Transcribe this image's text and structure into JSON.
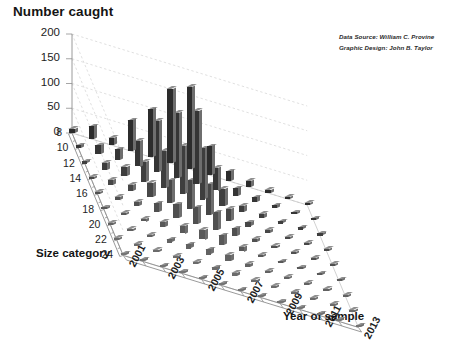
{
  "chart_data": {
    "type": "bar",
    "subtype": "3d-bar",
    "title": "Number caught",
    "xlabel": "Year of sample",
    "ylabel": "Number caught",
    "zlabel": "Size category",
    "ylim": [
      0,
      200
    ],
    "yticks": [
      0,
      50,
      100,
      150,
      200
    ],
    "grid": true,
    "legend": false,
    "x": [
      2001,
      2002,
      2003,
      2004,
      2005,
      2006,
      2007,
      2008,
      2009,
      2010,
      2011,
      2012,
      2013
    ],
    "xtick_labels": [
      "2001",
      "2003",
      "2005",
      "2007",
      "2009",
      "2011",
      "2013"
    ],
    "z_categories": [
      8,
      10,
      12,
      14,
      16,
      18,
      20,
      22,
      24
    ],
    "ztick_labels": [
      "8",
      "10",
      "12",
      "14",
      "16",
      "18",
      "20",
      "22",
      "24"
    ],
    "annotations": [
      "Data Source: William C. Provine",
      "Graphic Design: John B. Taylor"
    ],
    "series": [
      {
        "name": "8",
        "values": [
          8,
          26,
          14,
          62,
          96,
          150,
          166,
          58,
          20,
          12,
          7,
          5,
          3
        ]
      },
      {
        "name": "10",
        "values": [
          6,
          18,
          22,
          52,
          104,
          132,
          148,
          46,
          16,
          10,
          6,
          4,
          3
        ]
      },
      {
        "name": "12",
        "values": [
          5,
          14,
          18,
          40,
          74,
          96,
          104,
          34,
          12,
          8,
          5,
          3,
          2
        ]
      },
      {
        "name": "14",
        "values": [
          4,
          10,
          12,
          28,
          46,
          58,
          62,
          24,
          9,
          6,
          4,
          3,
          2
        ]
      },
      {
        "name": "16",
        "values": [
          3,
          7,
          9,
          18,
          28,
          34,
          36,
          16,
          7,
          5,
          3,
          2,
          2
        ]
      },
      {
        "name": "18",
        "values": [
          2,
          5,
          6,
          11,
          16,
          20,
          21,
          10,
          5,
          4,
          3,
          2,
          1
        ]
      },
      {
        "name": "20",
        "values": [
          2,
          3,
          4,
          7,
          9,
          11,
          12,
          6,
          4,
          3,
          2,
          2,
          1
        ]
      },
      {
        "name": "22",
        "values": [
          1,
          2,
          3,
          4,
          5,
          6,
          7,
          4,
          3,
          2,
          2,
          1,
          1
        ]
      },
      {
        "name": "24",
        "values": [
          1,
          1,
          2,
          2,
          3,
          4,
          4,
          3,
          2,
          2,
          1,
          1,
          1
        ]
      }
    ]
  },
  "labels": {
    "title": "Number caught",
    "xaxis_title": "Year of sample",
    "zaxis_title": "Size category"
  },
  "colors": {
    "bar_front": "#3a3a3a",
    "bar_side": "#6e6e6e",
    "bar_top": "#8f8f8f",
    "grid": "#cfcfcf",
    "axis": "#9a9a9a",
    "text": "#1a1a1a",
    "background": "#ffffff"
  }
}
